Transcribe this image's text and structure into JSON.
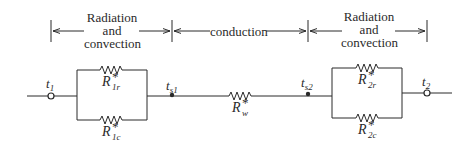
{
  "diagram": {
    "type": "thermal-resistance-network",
    "sections": [
      {
        "id": "left",
        "label_lines": [
          "Radiation",
          "and",
          "convection"
        ]
      },
      {
        "id": "middle",
        "label": "conduction"
      },
      {
        "id": "right",
        "label_lines": [
          "Radiation",
          "and",
          "convection"
        ]
      }
    ],
    "nodes": {
      "t1": {
        "symbol": "t",
        "sub": "1",
        "kind": "open-terminal"
      },
      "ts1": {
        "symbol": "t",
        "sub": "s1",
        "kind": "junction"
      },
      "ts2": {
        "symbol": "t",
        "sub": "s2",
        "kind": "junction"
      },
      "t2": {
        "symbol": "t",
        "sub": "2",
        "kind": "open-terminal"
      }
    },
    "resistors": {
      "R1r": {
        "symbol": "R",
        "sup": "*",
        "sub": "1r"
      },
      "R1c": {
        "symbol": "R",
        "sup": "*",
        "sub": "1c"
      },
      "Rw": {
        "symbol": "R",
        "sup": "*",
        "sub": "w"
      },
      "R2r": {
        "symbol": "R",
        "sup": "*",
        "sub": "2r"
      },
      "R2c": {
        "symbol": "R",
        "sup": "*",
        "sub": "2c"
      }
    },
    "colors": {
      "line": "#2a2a2a",
      "background": "#ffffff"
    }
  }
}
